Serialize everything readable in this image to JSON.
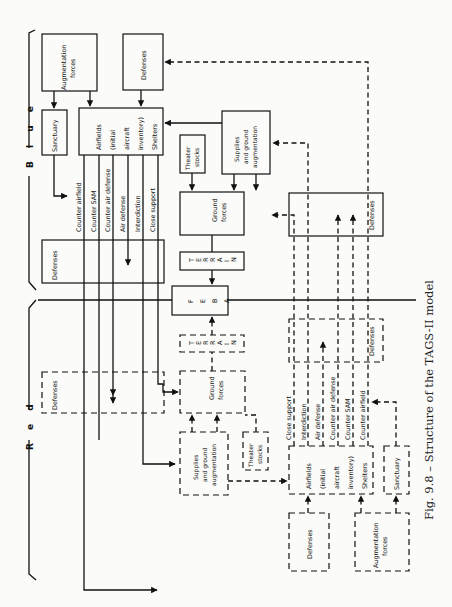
{
  "figure": {
    "caption": "Fig. 9.8 – Structure of the TAGS-II model",
    "side_labels": {
      "blue": "B l u e",
      "red": "R e d"
    },
    "central": {
      "feba": [
        "F",
        "E",
        "B",
        "A"
      ],
      "terrain": [
        "T",
        "E",
        "R",
        "R",
        "A",
        "I",
        "N"
      ]
    }
  },
  "blue": {
    "augmentation_forces": [
      "Augmentation",
      "forces"
    ],
    "defenses_top": "Defenses",
    "sanctuary": "Sanctuary",
    "airfields": [
      "Airfields",
      "(initial",
      "aircraft",
      "inventory)",
      "Shelters"
    ],
    "theater_stocks": [
      "Theater",
      "stocks"
    ],
    "supplies": [
      "Supplies",
      "and ground",
      "augmentation"
    ],
    "ground_forces": [
      "Ground",
      "forces"
    ],
    "defenses_mid": "Defenses",
    "defenses_right": "Defenses",
    "missions": [
      "Counter airfield",
      "Counter SAM",
      "Counter air defense",
      "Air defense",
      "Interdiction",
      "Close support"
    ]
  },
  "red": {
    "defenses_left": "Defenses",
    "ground_forces": [
      "Ground",
      "forces"
    ],
    "supplies": [
      "Supplies",
      "and ground",
      "augmentation"
    ],
    "theater_stocks": [
      "Theater",
      "stocks"
    ],
    "defenses_right": "Defenses",
    "airfields": [
      "Airfields",
      "(initial",
      "aircraft",
      "inventory)",
      "Shelters"
    ],
    "sanctuary": "Sanctuary",
    "defenses_bottom": "Defenses",
    "augmentation_forces": [
      "Augmentation",
      "forces"
    ],
    "missions": [
      "Close support",
      "Interdiction",
      "Air defense",
      "Counter air defense",
      "Counter SAM",
      "Counter airfield"
    ]
  }
}
